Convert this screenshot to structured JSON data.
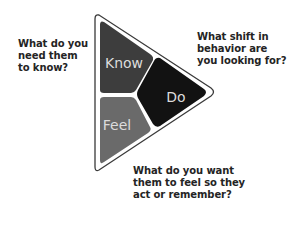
{
  "diagram": {
    "segments": [
      {
        "label": "Know",
        "color": "#3d3d3d"
      },
      {
        "label": "Do",
        "color": "#121212"
      },
      {
        "label": "Feel",
        "color": "#6a6a6a"
      }
    ],
    "outline_color": "#3a3a3a",
    "label_color": "#dcdcdc"
  },
  "questions": {
    "know": [
      "What do you",
      "need them",
      "to know?"
    ],
    "do": [
      "What shift in",
      "behavior are",
      "you looking for?"
    ],
    "feel": [
      "What do you want",
      "them to feel so they",
      "act or remember?"
    ]
  }
}
